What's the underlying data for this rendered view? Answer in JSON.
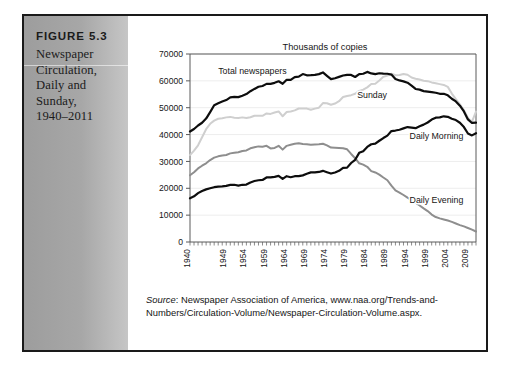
{
  "figure": {
    "number_label": "FIGURE 5.3",
    "caption_lines": [
      "Newspaper",
      "Circulation,",
      "Daily and",
      "Sunday,",
      "1940–2011"
    ]
  },
  "source": {
    "label": "Source",
    "text": ": Newspaper Association of America, www.naa.org/Trends-and-Numbers/Circulation-Volume/Newspaper-Circulation-Volume.aspx."
  },
  "colors": {
    "total_newspapers": "#0d0d0d",
    "daily_morning": "#0d0d0d",
    "daily_evening": "#8e8e8e",
    "sunday": "#cfcfcf",
    "axis": "#5a5a5a",
    "grid": "#ededed",
    "text": "#161616",
    "panel_light": "#c6c6c6",
    "panel_dark": "#9d9d9d"
  },
  "chart_data": {
    "type": "line",
    "title": "Thousands of copies",
    "xlabel": "",
    "ylabel": "",
    "xlim": [
      1940,
      2011
    ],
    "ylim": [
      0,
      70000
    ],
    "ytick_values": [
      0,
      10000,
      20000,
      30000,
      40000,
      50000,
      60000,
      70000
    ],
    "ytick_labels": [
      "0",
      "10000",
      "20000",
      "30000",
      "40000",
      "50000",
      "60000",
      "70000"
    ],
    "xtick_labels": [
      "1940",
      "1949",
      "1954",
      "1959",
      "1964",
      "1969",
      "1974",
      "1979",
      "1984",
      "1989",
      "1994",
      "1999",
      "2004",
      "2009"
    ],
    "xtick_values": [
      1940,
      1949,
      1954,
      1959,
      1964,
      1969,
      1974,
      1979,
      1984,
      1989,
      1994,
      1999,
      2004,
      2009
    ],
    "xtick_minor_step": 1,
    "grid": "horizontal",
    "legend": "inline-annotations",
    "annotations": [
      {
        "text": "Total newspapers",
        "x": 1947.0,
        "y": 62600,
        "anchor": "start"
      },
      {
        "text": "Sunday",
        "x": 1981.5,
        "y": 53600,
        "anchor": "start"
      },
      {
        "text": "Daily Morning",
        "x": 1994.5,
        "y": 38200,
        "anchor": "start"
      },
      {
        "text": "Daily Evening",
        "x": 1994.5,
        "y": 14500,
        "anchor": "start"
      }
    ],
    "series": [
      {
        "name": "Total newspapers",
        "color": "#0d0d0d",
        "x": [
          1940,
          1941,
          1942,
          1943,
          1944,
          1945,
          1946,
          1947,
          1948,
          1949,
          1950,
          1951,
          1952,
          1953,
          1954,
          1955,
          1956,
          1957,
          1958,
          1959,
          1960,
          1961,
          1962,
          1963,
          1964,
          1965,
          1966,
          1967,
          1968,
          1969,
          1970,
          1971,
          1972,
          1973,
          1974,
          1975,
          1976,
          1977,
          1978,
          1979,
          1980,
          1981,
          1982,
          1983,
          1984,
          1985,
          1986,
          1987,
          1988,
          1989,
          1990,
          1991,
          1992,
          1993,
          1994,
          1995,
          1996,
          1997,
          1998,
          1999,
          2000,
          2001,
          2002,
          2003,
          2004,
          2005,
          2006,
          2007,
          2008,
          2009,
          2010,
          2011
        ],
        "y": [
          41132,
          42080,
          43375,
          44400,
          45955,
          48384,
          50928,
          51673,
          52285,
          52846,
          53829,
          54018,
          53951,
          54472,
          55072,
          56147,
          57000,
          57805,
          58100,
          58882,
          58882,
          59261,
          59849,
          58905,
          60412,
          60358,
          61397,
          61561,
          62535,
          62060,
          62108,
          62231,
          62510,
          63147,
          61877,
          60655,
          60977,
          61495,
          61990,
          62223,
          62202,
          61431,
          62487,
          62645,
          63340,
          62766,
          62502,
          62826,
          62695,
          62649,
          62328,
          60687,
          60164,
          59812,
          59305,
          58193,
          56983,
          56728,
          56182,
          55979,
          55773,
          55578,
          55186,
          55185,
          54626,
          53345,
          52329,
          50742,
          48597,
          45653,
          44325,
          44421
        ]
      },
      {
        "name": "Sunday",
        "color": "#cfcfcf",
        "x": [
          1940,
          1941,
          1942,
          1943,
          1944,
          1945,
          1946,
          1947,
          1948,
          1949,
          1950,
          1951,
          1952,
          1953,
          1954,
          1955,
          1956,
          1957,
          1958,
          1959,
          1960,
          1961,
          1962,
          1963,
          1964,
          1965,
          1966,
          1967,
          1968,
          1969,
          1970,
          1971,
          1972,
          1973,
          1974,
          1975,
          1976,
          1977,
          1978,
          1979,
          1980,
          1981,
          1982,
          1983,
          1984,
          1985,
          1986,
          1987,
          1988,
          1989,
          1990,
          1991,
          1992,
          1993,
          1994,
          1995,
          1996,
          1997,
          1998,
          1999,
          2000,
          2001,
          2002,
          2003,
          2004,
          2005,
          2006,
          2007,
          2008,
          2009,
          2010,
          2011
        ],
        "y": [
          32371,
          34000,
          36000,
          39000,
          42000,
          44000,
          45200,
          45900,
          46100,
          46400,
          46582,
          46279,
          46207,
          46400,
          46175,
          46448,
          47000,
          47000,
          47000,
          47848,
          47699,
          48216,
          48600,
          46830,
          48383,
          48600,
          49000,
          49700,
          49693,
          49675,
          49217,
          49665,
          50000,
          51717,
          51679,
          51096,
          51565,
          52429,
          53990,
          54380,
          54676,
          55180,
          56261,
          56747,
          57574,
          58826,
          58925,
          60112,
          61496,
          62008,
          62635,
          62068,
          62160,
          62566,
          62295,
          61229,
          60798,
          60486,
          60066,
          59894,
          59421,
          59090,
          58780,
          58495,
          57754,
          55270,
          53179,
          51246,
          49115,
          46164,
          44796,
          48546
        ]
      },
      {
        "name": "Daily Evening",
        "color": "#8e8e8e",
        "x": [
          1940,
          1941,
          1942,
          1943,
          1944,
          1945,
          1946,
          1947,
          1948,
          1949,
          1950,
          1951,
          1952,
          1953,
          1954,
          1955,
          1956,
          1957,
          1958,
          1959,
          1960,
          1961,
          1962,
          1963,
          1964,
          1965,
          1966,
          1967,
          1968,
          1969,
          1970,
          1971,
          1972,
          1973,
          1974,
          1975,
          1976,
          1977,
          1978,
          1979,
          1980,
          1981,
          1982,
          1983,
          1984,
          1985,
          1986,
          1987,
          1988,
          1989,
          1990,
          1991,
          1992,
          1993,
          1994,
          1995,
          1996,
          1997,
          1998,
          1999,
          2000,
          2001,
          2002,
          2003,
          2004,
          2005,
          2006,
          2007,
          2008,
          2009,
          2010,
          2011
        ],
        "y": [
          24841,
          26000,
          27400,
          28400,
          29300,
          30500,
          31400,
          31900,
          32200,
          32400,
          33000,
          33200,
          33400,
          33900,
          34100,
          34900,
          35300,
          35600,
          35500,
          35799,
          34852,
          35025,
          35800,
          34400,
          35800,
          36200,
          36600,
          36800,
          36500,
          36400,
          36174,
          36321,
          36432,
          36600,
          36000,
          35165,
          35100,
          35000,
          34900,
          34500,
          32787,
          31200,
          29300,
          28800,
          28000,
          26400,
          25900,
          25100,
          24000,
          23000,
          21017,
          19200,
          18400,
          17500,
          16500,
          15600,
          14600,
          13600,
          12500,
          11500,
          10200,
          9300,
          8800,
          8400,
          8000,
          7500,
          6900,
          6300,
          5800,
          5200,
          4600,
          3900
        ]
      },
      {
        "name": "Daily Morning",
        "color": "#0d0d0d",
        "x": [
          1940,
          1941,
          1942,
          1943,
          1944,
          1945,
          1946,
          1947,
          1948,
          1949,
          1950,
          1951,
          1952,
          1953,
          1954,
          1955,
          1956,
          1957,
          1958,
          1959,
          1960,
          1961,
          1962,
          1963,
          1964,
          1965,
          1966,
          1967,
          1968,
          1969,
          1970,
          1971,
          1972,
          1973,
          1974,
          1975,
          1976,
          1977,
          1978,
          1979,
          1980,
          1981,
          1982,
          1983,
          1984,
          1985,
          1986,
          1987,
          1988,
          1989,
          1990,
          1991,
          1992,
          1993,
          1994,
          1995,
          1996,
          1997,
          1998,
          1999,
          2000,
          2001,
          2002,
          2003,
          2004,
          2005,
          2006,
          2007,
          2008,
          2009,
          2010,
          2011
        ],
        "y": [
          16290,
          17000,
          18200,
          19000,
          19600,
          20000,
          20400,
          20600,
          20700,
          20900,
          21266,
          21300,
          21000,
          21300,
          21400,
          22183,
          22700,
          23000,
          23100,
          24027,
          24029,
          24236,
          24600,
          23500,
          24500,
          24100,
          24500,
          24500,
          24800,
          25400,
          25934,
          25900,
          26078,
          26500,
          26000,
          25490,
          25900,
          26500,
          27600,
          27700,
          29414,
          30600,
          33200,
          33800,
          35400,
          36400,
          36600,
          37700,
          38700,
          39600,
          41311,
          41500,
          41800,
          42300,
          42800,
          42600,
          42400,
          43100,
          43700,
          44500,
          45600,
          46300,
          46400,
          46800,
          46600,
          45900,
          45400,
          44400,
          42800,
          40400,
          39700,
          40500
        ]
      }
    ]
  }
}
